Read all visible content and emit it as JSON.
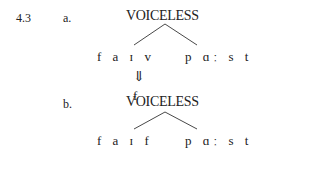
{
  "example": {
    "number": "4.3",
    "a": {
      "label": "a.",
      "feature": "VOICELESS",
      "left_word": "f a ɪ v",
      "right_word": "p ɑː s t"
    },
    "arrow": "⇓",
    "b": {
      "label": "b.",
      "delinked_segment": "f",
      "feature": "VOICELESS",
      "left_word": "f a ɪ f",
      "right_word": "p ɑː s t"
    }
  }
}
